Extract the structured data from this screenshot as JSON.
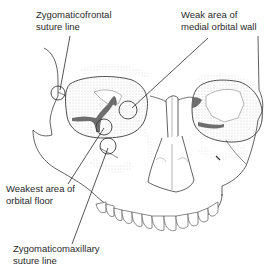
{
  "figure": {
    "colors": {
      "line": "#3a3a3a",
      "shade": "#b8b8b8",
      "dark_fill": "#6e6e6e",
      "background": "#ffffff"
    },
    "labels": [
      {
        "id": "zygomaticofrontal",
        "line1": "Zygomaticofrontal",
        "line2": "suture line"
      },
      {
        "id": "medial-wall",
        "line1": "Weak area of",
        "line2": "medial orbital wall"
      },
      {
        "id": "orbital-floor",
        "line1": "Weakest area of",
        "line2": "orbital floor"
      },
      {
        "id": "zygomaticomaxillary",
        "line1": "Zygomaticomaxillary",
        "line2": "suture line"
      }
    ]
  }
}
